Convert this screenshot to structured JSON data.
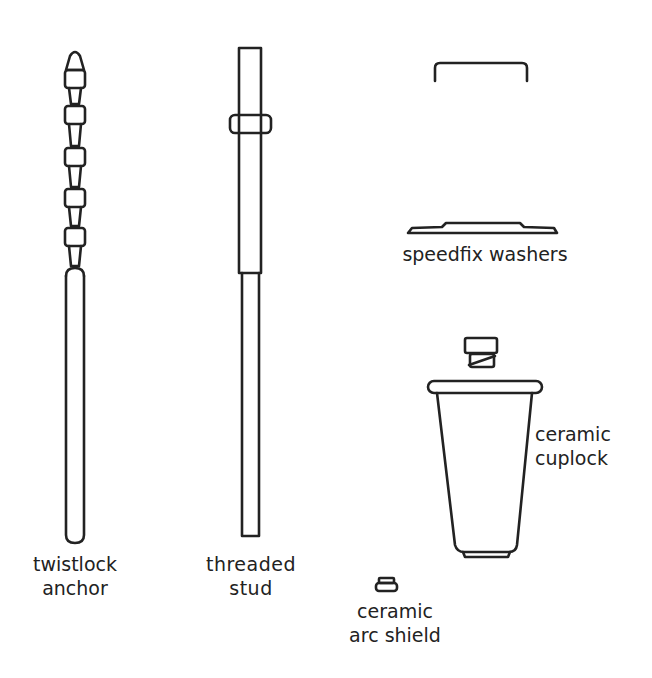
{
  "diagram": {
    "ink_color": "#222222",
    "background": "#ffffff",
    "components": [
      {
        "id": "twistlock-anchor",
        "label_lines": [
          "twistlock",
          "anchor"
        ]
      },
      {
        "id": "threaded-stud",
        "label_lines": [
          "threaded",
          "stud"
        ]
      },
      {
        "id": "speedfix-washers",
        "label_lines": [
          "speedfix washers"
        ]
      },
      {
        "id": "ceramic-cuplock",
        "label_lines": [
          "ceramic",
          "cuplock"
        ]
      },
      {
        "id": "ceramic-arc-shield",
        "label_lines": [
          "ceramic",
          "arc shield"
        ]
      }
    ]
  }
}
